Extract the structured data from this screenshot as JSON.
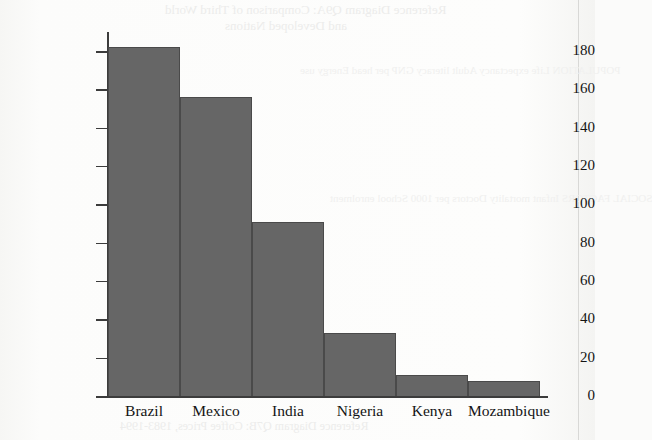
{
  "chart_data": {
    "type": "bar",
    "title": "",
    "xlabel": "",
    "ylabel": "Debt ($ thousand million (billion))",
    "categories": [
      "Brazil",
      "Mexico",
      "India",
      "Nigeria",
      "Kenya",
      "Mozambique"
    ],
    "values": [
      182,
      156,
      91,
      33,
      11,
      8
    ],
    "ylim": [
      0,
      190
    ],
    "yticks": [
      0,
      20,
      40,
      60,
      80,
      100,
      120,
      140,
      160,
      180
    ],
    "ytick_labels": [
      "0",
      "20",
      "40",
      "60",
      "80",
      "100",
      "120",
      "140",
      "160",
      "180"
    ],
    "grid": false,
    "legend": "none",
    "bar_color": "#666666",
    "bar_edge_color": "#4a4a4a",
    "axis_color": "#3c3c3c",
    "bars_adjacent": true
  },
  "page": {
    "background_color": "#fbfbfa",
    "showthrough": {
      "title_line_1": "Reference Diagram Q9A: Comparison of Third World",
      "title_line_2": "and Developed Nations",
      "caption": "Reference Diagram Q7B: Coffee Prices, 1983-1994",
      "block_left": "POPULATION\nLife expectancy\nAdult literacy\nGNP per head\nEnergy use",
      "block_right": "SOCIAL FACTORS\nInfant mortality\nDoctors per 1000\nSchool enrolment"
    }
  }
}
